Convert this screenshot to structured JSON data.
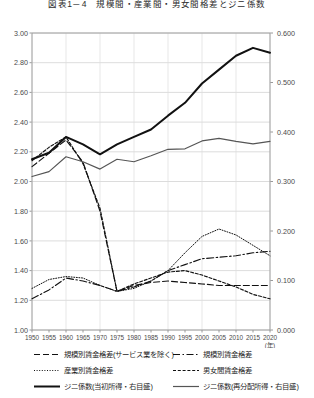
{
  "title": "図表1－4　規模間・産業間・男女間格差とジニ係数",
  "axes": {
    "left_ticks": [
      "3.00",
      "2.80",
      "2.60",
      "2.40",
      "2.20",
      "2.00",
      "1.80",
      "1.60",
      "1.40",
      "1.20",
      "1.00"
    ],
    "right_ticks": [
      "0.600",
      "0.500",
      "0.400",
      "0.300",
      "0.200",
      "0.100",
      "0.000"
    ],
    "x_ticks": [
      "1950",
      "1955",
      "1960",
      "1965",
      "1970",
      "1975",
      "1980",
      "1985",
      "1990",
      "1995",
      "2000",
      "2005",
      "2010",
      "2015",
      "2020"
    ],
    "x_unit": "(年)"
  },
  "legend": {
    "items": [
      {
        "label": "規模別賃金格差(サービス業を除く)",
        "style": "long-dash",
        "color": "#111111"
      },
      {
        "label": "規模別賃金格差",
        "style": "dash-dot",
        "color": "#111111"
      },
      {
        "label": "産業別賃金格差",
        "style": "dotted",
        "color": "#111111"
      },
      {
        "label": "男女間賃金格差",
        "style": "short-dash",
        "color": "#111111"
      },
      {
        "label": "ジニ係数(当初所得・右目盛)",
        "style": "solid-thick",
        "color": "#111111"
      },
      {
        "label": "ジニ係数(再分配所得・右目盛)",
        "style": "solid-thin",
        "color": "#555555"
      }
    ]
  },
  "chart_data": {
    "type": "line",
    "title": "図表1－4　規模間・産業間・男女間格差とジニ係数",
    "xlabel": "(年)",
    "ylabel": "",
    "ylabel_right": "",
    "xlim": [
      1950,
      2020
    ],
    "ylim": [
      1.0,
      3.0
    ],
    "ylim_right": [
      0.0,
      0.6
    ],
    "grid": true,
    "legend_position": "bottom",
    "x": [
      1950,
      1955,
      1960,
      1965,
      1970,
      1975,
      1980,
      1985,
      1990,
      1995,
      2000,
      2005,
      2010,
      2015,
      2020
    ],
    "series": [
      {
        "name": "規模別賃金格差(サービス業を除く)",
        "axis": "left",
        "style": "long-dash",
        "x": [
          1950,
          1955,
          1960,
          1965,
          1970,
          1975,
          1980,
          1985,
          1990,
          1995,
          2000,
          2005,
          2010,
          2015,
          2020
        ],
        "values": [
          2.1,
          2.19,
          2.28,
          2.13,
          1.8,
          1.26,
          1.3,
          1.32,
          1.33,
          1.32,
          1.31,
          1.3,
          1.3,
          1.3,
          1.3
        ]
      },
      {
        "name": "規模別賃金格差",
        "axis": "left",
        "style": "dash-dot",
        "x": [
          1950,
          1955,
          1960,
          1965,
          1970,
          1975,
          1980,
          1985,
          1990,
          1995,
          2000,
          2005,
          2010,
          2015,
          2020
        ],
        "values": [
          1.21,
          1.27,
          1.35,
          1.33,
          1.3,
          1.26,
          1.29,
          1.33,
          1.4,
          1.44,
          1.48,
          1.49,
          1.5,
          1.52,
          1.53
        ]
      },
      {
        "name": "産業別賃金格差",
        "axis": "left",
        "style": "dotted",
        "x": [
          1950,
          1955,
          1960,
          1965,
          1970,
          1975,
          1980,
          1985,
          1990,
          1995,
          2000,
          2005,
          2010,
          2015,
          2020
        ],
        "values": [
          1.28,
          1.34,
          1.36,
          1.35,
          1.3,
          1.26,
          1.28,
          1.33,
          1.4,
          1.52,
          1.63,
          1.68,
          1.64,
          1.57,
          1.5
        ]
      },
      {
        "name": "男女間賃金格差",
        "axis": "left",
        "style": "short-dash",
        "x": [
          1950,
          1955,
          1960,
          1965,
          1970,
          1975,
          1980,
          1985,
          1990,
          1995,
          2000,
          2005,
          2010,
          2015,
          2020
        ],
        "values": [
          2.14,
          2.23,
          2.3,
          2.12,
          1.82,
          1.26,
          1.31,
          1.35,
          1.39,
          1.4,
          1.37,
          1.33,
          1.29,
          1.24,
          1.21
        ]
      },
      {
        "name": "ジニ係数(当初所得・右目盛)",
        "axis": "right",
        "style": "solid-thick",
        "x": [
          1950,
          1955,
          1960,
          1965,
          1970,
          1975,
          1980,
          1985,
          1990,
          1995,
          2000,
          2005,
          2010,
          2015,
          2020
        ],
        "values": [
          0.345,
          0.358,
          0.39,
          0.375,
          0.355,
          0.375,
          0.39,
          0.405,
          0.433,
          0.459,
          0.498,
          0.526,
          0.554,
          0.57,
          0.56
        ]
      },
      {
        "name": "ジニ係数(再分配所得・右目盛)",
        "axis": "right",
        "style": "solid-thin",
        "x": [
          1950,
          1955,
          1960,
          1965,
          1970,
          1975,
          1980,
          1985,
          1990,
          1995,
          2000,
          2005,
          2010,
          2015,
          2020
        ],
        "values": [
          0.31,
          0.32,
          0.35,
          0.34,
          0.325,
          0.345,
          0.34,
          0.352,
          0.365,
          0.366,
          0.382,
          0.387,
          0.381,
          0.376,
          0.381
        ]
      }
    ]
  }
}
